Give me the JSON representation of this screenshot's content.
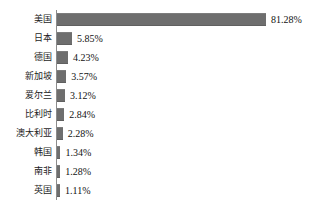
{
  "chart_data": {
    "type": "bar",
    "orientation": "horizontal",
    "title": "",
    "subtitle": "",
    "xlabel": "",
    "ylabel": "",
    "grid": false,
    "legend": null,
    "legend_position": "none",
    "xlim": [
      0,
      81.28
    ],
    "categories": [
      "美国",
      "日本",
      "德国",
      "新加坡",
      "爱尔兰",
      "比利时",
      "澳大利亚",
      "韩国",
      "南非",
      "英国"
    ],
    "values": [
      81.28,
      5.85,
      4.23,
      3.57,
      3.12,
      2.84,
      2.28,
      1.34,
      1.28,
      1.11
    ],
    "value_labels": [
      "81.28%",
      "5.85%",
      "4.23%",
      "3.57%",
      "3.12%",
      "2.84%",
      "2.28%",
      "1.34%",
      "1.28%",
      "1.11%"
    ],
    "bar_color": "#6e6e6e",
    "axis_color": "#8c8c8c",
    "background": "#ffffff",
    "rows": [
      {
        "label": "美国",
        "value": 81.28,
        "value_label": "81.28%"
      },
      {
        "label": "日本",
        "value": 5.85,
        "value_label": "5.85%"
      },
      {
        "label": "德国",
        "value": 4.23,
        "value_label": "4.23%"
      },
      {
        "label": "新加坡",
        "value": 3.57,
        "value_label": "3.57%"
      },
      {
        "label": "爱尔兰",
        "value": 3.12,
        "value_label": "3.12%"
      },
      {
        "label": "比利时",
        "value": 2.84,
        "value_label": "2.84%"
      },
      {
        "label": "澳大利亚",
        "value": 2.28,
        "value_label": "2.28%"
      },
      {
        "label": "韩国",
        "value": 1.34,
        "value_label": "1.34%"
      },
      {
        "label": "南非",
        "value": 1.28,
        "value_label": "1.28%"
      },
      {
        "label": "英国",
        "value": 1.11,
        "value_label": "1.11%"
      }
    ]
  }
}
